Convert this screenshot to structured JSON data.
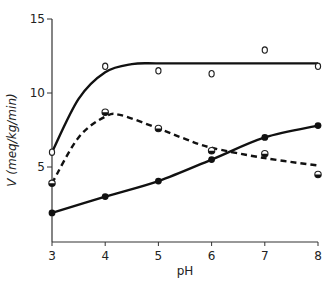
{
  "chart_data": {
    "type": "line",
    "title": "",
    "xlabel": "pH",
    "ylabel": "V (meq/kg/min)",
    "xlim": [
      3,
      8
    ],
    "ylim": [
      0,
      15
    ],
    "xticks": [
      3,
      4,
      5,
      6,
      7,
      8
    ],
    "yticks": [
      5,
      10,
      15
    ],
    "grid": false,
    "legend": null,
    "series": [
      {
        "name": "open circles (solid curve, saturating)",
        "marker": "open-circle",
        "line": "solid",
        "points": [
          [
            3,
            6.0
          ],
          [
            4,
            11.8
          ],
          [
            5,
            11.5
          ],
          [
            6,
            11.3
          ],
          [
            7,
            12.9
          ],
          [
            8,
            11.8
          ]
        ],
        "curve": [
          [
            3,
            6.0
          ],
          [
            3.5,
            9.6
          ],
          [
            4,
            11.4
          ],
          [
            4.5,
            11.95
          ],
          [
            5,
            12.0
          ],
          [
            6,
            12.0
          ],
          [
            7,
            12.0
          ],
          [
            8,
            12.0
          ]
        ]
      },
      {
        "name": "half-filled circles (dashed curve, peaked)",
        "marker": "half-filled-circle",
        "line": "dashed",
        "points": [
          [
            3,
            3.9
          ],
          [
            4,
            8.7
          ],
          [
            5,
            7.6
          ],
          [
            6,
            6.1
          ],
          [
            7,
            5.9
          ],
          [
            8,
            4.5
          ]
        ],
        "curve": [
          [
            3,
            3.9
          ],
          [
            3.5,
            7.0
          ],
          [
            4,
            8.4
          ],
          [
            4.3,
            8.5
          ],
          [
            5,
            7.6
          ],
          [
            5.5,
            6.9
          ],
          [
            6,
            6.3
          ],
          [
            7,
            5.6
          ],
          [
            8,
            5.1
          ]
        ]
      },
      {
        "name": "filled circles (solid curve, rising)",
        "marker": "filled-circle",
        "line": "solid",
        "points": [
          [
            3,
            1.9
          ],
          [
            4,
            3.0
          ],
          [
            5,
            4.05
          ],
          [
            6,
            5.5
          ],
          [
            7,
            7.0
          ],
          [
            8,
            7.8
          ]
        ],
        "curve": [
          [
            3,
            1.9
          ],
          [
            4,
            3.0
          ],
          [
            5,
            4.05
          ],
          [
            6,
            5.5
          ],
          [
            7,
            7.0
          ],
          [
            8,
            7.8
          ]
        ]
      }
    ]
  },
  "axes": {
    "x_title": "pH",
    "y_title": "V (meq/kg/min)",
    "x_tick_labels": [
      "3",
      "4",
      "5",
      "6",
      "7",
      "8"
    ],
    "y_tick_labels": [
      "5",
      "10",
      "15"
    ]
  }
}
